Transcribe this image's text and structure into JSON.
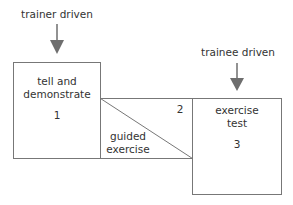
{
  "diagram": {
    "top_left_label": "trainer driven",
    "top_right_label": "trainee driven",
    "box1": {
      "line1": "tell and",
      "line2": "demonstrate",
      "number": "1"
    },
    "box2": {
      "line1": "guided",
      "line2": "exercise",
      "number": "2"
    },
    "box3": {
      "line1": "exercise",
      "line2": "test",
      "number": "3"
    },
    "colors": {
      "line": "#777777",
      "arrow": "#6e6e6e",
      "text": "#333333"
    }
  }
}
